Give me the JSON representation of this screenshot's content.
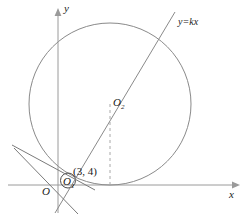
{
  "figure": {
    "type": "geometry-diagram",
    "background_color": "#ffffff",
    "stroke_color": "#8a8a8a",
    "text_color": "#1a1a1a"
  },
  "axes": {
    "x_label": "x",
    "y_label": "y",
    "origin_label": "O",
    "x_axis": {
      "y_px": 185,
      "x_start": 8,
      "x_end": 238
    },
    "y_axis": {
      "x_px": 58,
      "y_start": 10,
      "y_end": 213
    }
  },
  "labels": {
    "circle_big_center": "O",
    "circle_big_center_sub": "2",
    "circle_small_center": "O",
    "circle_small_center_sub": "1",
    "point_coords": "(3, 4)",
    "line_equation": "y=kx"
  },
  "shapes": {
    "big_circle": {
      "cx": 110,
      "cy": 104,
      "r": 81,
      "tangent_to": "x-axis"
    },
    "small_circle": {
      "cx": 68,
      "cy": 180,
      "r": 8
    },
    "line_y_eq_kx": {
      "through": [
        "origin-region",
        "O2"
      ],
      "slope_label": "y=kx"
    },
    "dashed_drop_line": {
      "from": [
        110,
        104
      ],
      "to": [
        110,
        185
      ]
    },
    "tangent_lines_count": 2
  },
  "colors": {
    "curve": "#8a8a8a",
    "axis": "#9a9a9a",
    "dashed": "#a8a8a8",
    "text": "#1a1a1a"
  }
}
